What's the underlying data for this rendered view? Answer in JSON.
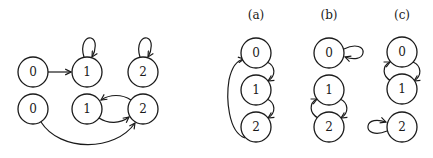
{
  "diagram": {
    "stroke_color": "#1a1a1a",
    "background": "#ffffff",
    "left_graph": {
      "rows": [
        {
          "nodes": [
            {
              "id": "0",
              "label": "0",
              "cx": 33,
              "cy": 72
            },
            {
              "id": "1",
              "label": "1",
              "cx": 87,
              "cy": 72
            },
            {
              "id": "2",
              "label": "2",
              "cx": 143,
              "cy": 72
            }
          ],
          "edges": [
            {
              "from": "0",
              "to": "1",
              "type": "straight"
            },
            {
              "from": "1",
              "to": "1",
              "type": "self-loop-top"
            },
            {
              "from": "2",
              "to": "2",
              "type": "self-loop-top"
            }
          ]
        },
        {
          "nodes": [
            {
              "id": "0",
              "label": "0",
              "cx": 33,
              "cy": 109
            },
            {
              "id": "1",
              "label": "1",
              "cx": 87,
              "cy": 109
            },
            {
              "id": "2",
              "label": "2",
              "cx": 143,
              "cy": 109
            }
          ],
          "edges": [
            {
              "from": "0",
              "to": "2",
              "type": "arc-below"
            },
            {
              "from": "1",
              "to": "2",
              "type": "arc-below"
            },
            {
              "from": "2",
              "to": "1",
              "type": "arc-above"
            }
          ]
        }
      ]
    },
    "panels": [
      {
        "label": "(a)",
        "nodes": [
          {
            "id": "0",
            "label": "0"
          },
          {
            "id": "1",
            "label": "1"
          },
          {
            "id": "2",
            "label": "2"
          }
        ],
        "edges": [
          {
            "from": "0",
            "to": "1",
            "side": "right"
          },
          {
            "from": "1",
            "to": "2",
            "side": "right"
          },
          {
            "from": "2",
            "to": "0",
            "side": "left-long"
          }
        ]
      },
      {
        "label": "(b)",
        "nodes": [
          {
            "id": "0",
            "label": "0"
          },
          {
            "id": "1",
            "label": "1"
          },
          {
            "id": "2",
            "label": "2"
          }
        ],
        "edges": [
          {
            "from": "0",
            "to": "0",
            "side": "self-loop-right"
          },
          {
            "from": "1",
            "to": "2",
            "side": "right"
          },
          {
            "from": "2",
            "to": "1",
            "side": "left"
          }
        ]
      },
      {
        "label": "(c)",
        "nodes": [
          {
            "id": "0",
            "label": "0"
          },
          {
            "id": "1",
            "label": "1"
          },
          {
            "id": "2",
            "label": "2"
          }
        ],
        "edges": [
          {
            "from": "0",
            "to": "1",
            "side": "right"
          },
          {
            "from": "1",
            "to": "0",
            "side": "left"
          },
          {
            "from": "2",
            "to": "2",
            "side": "self-loop-left"
          }
        ]
      }
    ]
  }
}
